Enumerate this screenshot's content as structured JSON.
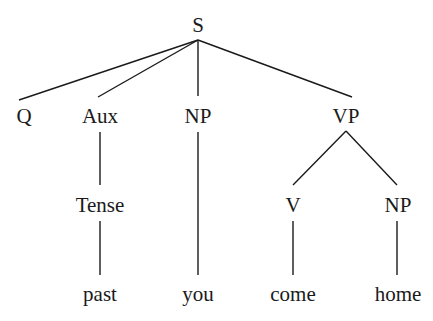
{
  "diagram": {
    "type": "syntax-tree",
    "root": "S",
    "nodes": {
      "s": "S",
      "q": "Q",
      "aux": "Aux",
      "np_subject": "NP",
      "vp": "VP",
      "tense": "Tense",
      "v": "V",
      "np_object": "NP",
      "past": "past",
      "you": "you",
      "come": "come",
      "home": "home"
    },
    "edges": [
      [
        "S",
        "Q"
      ],
      [
        "S",
        "Aux"
      ],
      [
        "S",
        "NP"
      ],
      [
        "S",
        "VP"
      ],
      [
        "Aux",
        "Tense"
      ],
      [
        "Tense",
        "past"
      ],
      [
        "NP",
        "you"
      ],
      [
        "VP",
        "V"
      ],
      [
        "VP",
        "NP"
      ],
      [
        "V",
        "come"
      ],
      [
        "NP",
        "home"
      ]
    ],
    "colors": {
      "ink": "#1a1a1a",
      "background": "#ffffff"
    }
  }
}
